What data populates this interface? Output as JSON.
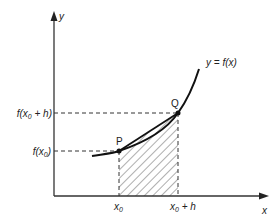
{
  "diagram": {
    "axes": {
      "x_label": "x",
      "y_label": "y"
    },
    "curve_label": "y = f(x)",
    "points": [
      {
        "name": "P",
        "x_label": "x0",
        "y_label": "f(x0)"
      },
      {
        "name": "Q",
        "x_label": "x0 + h",
        "y_label": "f(x0 + h)"
      }
    ],
    "labels": {
      "x0_base": "x",
      "x0_sub": "0",
      "x0h_base": "x",
      "x0h_sub": "0",
      "x0h_suffix": " + h",
      "fx0_pre": "f(x",
      "fx0_sub": "0",
      "fx0_post": ")",
      "fx0h_pre": "f(x",
      "fx0h_sub": "0",
      "fx0h_post": " + h)",
      "p": "P",
      "q": "Q"
    },
    "shaded_region": "hatched trapezoid between x0 and x0 + h",
    "colors": {
      "line": "#222222",
      "background": "#ffffff"
    }
  }
}
